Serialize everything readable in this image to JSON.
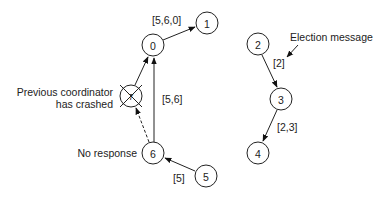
{
  "diagram": {
    "type": "ring-election",
    "nodes": [
      {
        "id": "0",
        "label": "0",
        "cx": 153,
        "cy": 45
      },
      {
        "id": "1",
        "label": "1",
        "cx": 207,
        "cy": 23
      },
      {
        "id": "7",
        "label": "7",
        "cx": 131,
        "cy": 96,
        "crashed": true
      },
      {
        "id": "6",
        "label": "6",
        "cx": 153,
        "cy": 153
      },
      {
        "id": "5",
        "label": "5",
        "cx": 206,
        "cy": 176
      },
      {
        "id": "2",
        "label": "2",
        "cx": 258,
        "cy": 44
      },
      {
        "id": "3",
        "label": "3",
        "cx": 281,
        "cy": 99
      },
      {
        "id": "4",
        "label": "4",
        "cx": 258,
        "cy": 153
      }
    ],
    "edges": [
      {
        "from": "0",
        "to": "1",
        "label": "[5,6,0]",
        "style": "solid"
      },
      {
        "from": "6",
        "to": "0",
        "label": "[5,6]",
        "style": "solid"
      },
      {
        "from": "5",
        "to": "6",
        "label": "[5]",
        "style": "solid"
      },
      {
        "from": "6",
        "to": "7",
        "label": "",
        "style": "dashed"
      },
      {
        "from": "7",
        "to": "0",
        "label": "",
        "style": "solid"
      },
      {
        "from": "2",
        "to": "3",
        "label": "[2]",
        "style": "solid"
      },
      {
        "from": "3",
        "to": "4",
        "label": "[2,3]",
        "style": "solid"
      }
    ],
    "annotations": {
      "crashed_line1": "Previous coordinator",
      "crashed_line2": "has crashed",
      "no_response": "No response",
      "election_message": "Election message"
    },
    "edge_labels": {
      "e01": "[5,6,0]",
      "e60": "[5,6]",
      "e56": "[5]",
      "e23": "[2]",
      "e34": "[2,3]"
    },
    "colors": {
      "stroke": "#222222",
      "background": "#ffffff"
    }
  }
}
